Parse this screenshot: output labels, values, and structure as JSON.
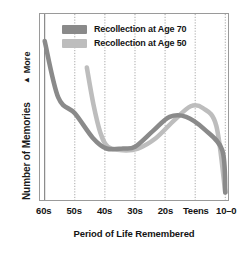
{
  "chart_data": {
    "type": "line",
    "title": "",
    "xlabel": "Period of Life Remembered",
    "ylabel": "Number of Memories",
    "y_axis_top_marker": "More",
    "y_axis_arrow_glyph": "▲",
    "categories": [
      "60s",
      "50s",
      "40s",
      "30s",
      "20s",
      "Teens",
      "10–0"
    ],
    "grid": "vertical dotted gridlines at each category",
    "legend_position": "inside top-left of plot area",
    "ylim": [
      0,
      100
    ],
    "yticks": [],
    "series": [
      {
        "name": "Recollection at Age 70",
        "color": "#8a8a8a",
        "values": [
          88,
          47,
          27,
          28,
          45,
          41,
          2
        ],
        "points": [
          {
            "x": 0.0,
            "y": 88
          },
          {
            "x": 0.45,
            "y": 56
          },
          {
            "x": 1.0,
            "y": 47
          },
          {
            "x": 1.6,
            "y": 33
          },
          {
            "x": 2.05,
            "y": 27
          },
          {
            "x": 2.6,
            "y": 27
          },
          {
            "x": 3.0,
            "y": 28
          },
          {
            "x": 3.6,
            "y": 37
          },
          {
            "x": 4.15,
            "y": 45
          },
          {
            "x": 4.7,
            "y": 45
          },
          {
            "x": 5.3,
            "y": 38
          },
          {
            "x": 5.9,
            "y": 26
          },
          {
            "x": 6.0,
            "y": 2
          }
        ]
      },
      {
        "name": "Recollection at Age 50",
        "color": "#bdbdbd",
        "values": [
          null,
          73,
          28,
          27,
          40,
          51,
          2
        ],
        "points": [
          {
            "x": 1.4,
            "y": 73
          },
          {
            "x": 1.62,
            "y": 52
          },
          {
            "x": 1.85,
            "y": 36
          },
          {
            "x": 2.1,
            "y": 28
          },
          {
            "x": 2.6,
            "y": 26
          },
          {
            "x": 3.1,
            "y": 27
          },
          {
            "x": 3.7,
            "y": 33
          },
          {
            "x": 4.3,
            "y": 43
          },
          {
            "x": 4.85,
            "y": 51
          },
          {
            "x": 5.25,
            "y": 50
          },
          {
            "x": 5.7,
            "y": 40
          },
          {
            "x": 6.0,
            "y": 2
          }
        ]
      }
    ]
  },
  "legend": {
    "items": [
      {
        "label": "Recollection at Age 70",
        "color": "#8a8a8a"
      },
      {
        "label": "Recollection at Age 50",
        "color": "#bdbdbd"
      }
    ]
  },
  "axes": {
    "x_title": "Period of Life Remembered",
    "y_title": "Number of Memories",
    "y_more_label": "More",
    "y_more_arrow": "▲",
    "x_ticks": [
      "60s",
      "50s",
      "40s",
      "30s",
      "20s",
      "Teens",
      "10–0"
    ]
  },
  "colors": {
    "series_age70": "#8a8a8a",
    "series_age50": "#bdbdbd",
    "frame": "#9a9a9a",
    "gridline": "#8f8f8f",
    "text": "#141414",
    "background": "#ffffff"
  }
}
